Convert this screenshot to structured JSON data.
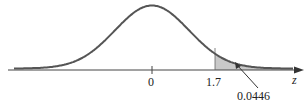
{
  "figure": {
    "type": "standard normal curve with shaded right tail",
    "axis_variable": "z",
    "tick_labels": [
      "0",
      "1.7"
    ],
    "shaded_area_label": "0.0446",
    "colors": {
      "curve": "#555555",
      "shade": "#c8c8c8",
      "axis": "#444444"
    }
  }
}
